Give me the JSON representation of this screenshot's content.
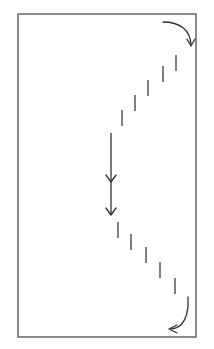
{
  "figure": {
    "title": "",
    "caption": "",
    "background_color": "#ffffff",
    "width": 214,
    "height": 349
  },
  "colors": {
    "frame_stroke": "#5a5a5a",
    "dash_stroke": "#5f5f5f",
    "arrow_stroke": "#333333",
    "background": "#ffffff"
  },
  "frame": {
    "name": "boundary-rectangle",
    "x": 18,
    "y": 14,
    "width": 178,
    "height": 323,
    "stroke_width": 1.4
  },
  "chart_data": {
    "type": "diagram",
    "title": "",
    "xlabel": "",
    "ylabel": "",
    "elements": [
      {
        "kind": "rectangle",
        "label": "boundary"
      },
      {
        "kind": "dashed-path",
        "label": "upper-diagonal-dashes",
        "count": 5
      },
      {
        "kind": "dashed-path",
        "label": "lower-diagonal-dashes",
        "count": 5
      },
      {
        "kind": "straight-arrow",
        "label": "central-double-arrow",
        "heads": 2
      },
      {
        "kind": "curved-arrow",
        "label": "top-right-curve",
        "direction": "down"
      },
      {
        "kind": "curved-arrow",
        "label": "bottom-right-curve",
        "direction": "left"
      }
    ]
  },
  "dashes": {
    "stroke_width": 1.6,
    "upper": [
      {
        "id": "dash-upper-1",
        "x1": 176,
        "y1": 55,
        "x2": 176,
        "y2": 71
      },
      {
        "id": "dash-upper-2",
        "x1": 163,
        "y1": 66,
        "x2": 163,
        "y2": 82
      },
      {
        "id": "dash-upper-3",
        "x1": 148,
        "y1": 80,
        "x2": 148,
        "y2": 96
      },
      {
        "id": "dash-upper-4",
        "x1": 135,
        "y1": 95,
        "x2": 135,
        "y2": 111
      },
      {
        "id": "dash-upper-5",
        "x1": 122,
        "y1": 110,
        "x2": 122,
        "y2": 126
      }
    ],
    "lower": [
      {
        "id": "dash-lower-1",
        "x1": 118,
        "y1": 222,
        "x2": 118,
        "y2": 238
      },
      {
        "id": "dash-lower-2",
        "x1": 131,
        "y1": 234,
        "x2": 131,
        "y2": 250
      },
      {
        "id": "dash-lower-3",
        "x1": 146,
        "y1": 247,
        "x2": 146,
        "y2": 263
      },
      {
        "id": "dash-lower-4",
        "x1": 160,
        "y1": 262,
        "x2": 160,
        "y2": 278
      },
      {
        "id": "dash-lower-5",
        "x1": 175,
        "y1": 278,
        "x2": 175,
        "y2": 294
      }
    ]
  },
  "arrows": {
    "stroke_width": 1.3,
    "central": {
      "id": "central-double-arrow",
      "x": 111,
      "y_start": 133,
      "y_end": 214,
      "head_mid_y": 180,
      "head_size": 5
    },
    "top_right": {
      "id": "top-right-curved-arrow",
      "path": "M 163 22 C 180 22, 190 30, 191 44",
      "head": "M 187 39 L 191 46 L 195 39"
    },
    "bottom_right": {
      "id": "bottom-right-curved-arrow",
      "path": "M 188 297 C 189 315, 184 328, 171 329",
      "head": "M 177 325 L 169 329 L 177 333"
    }
  }
}
